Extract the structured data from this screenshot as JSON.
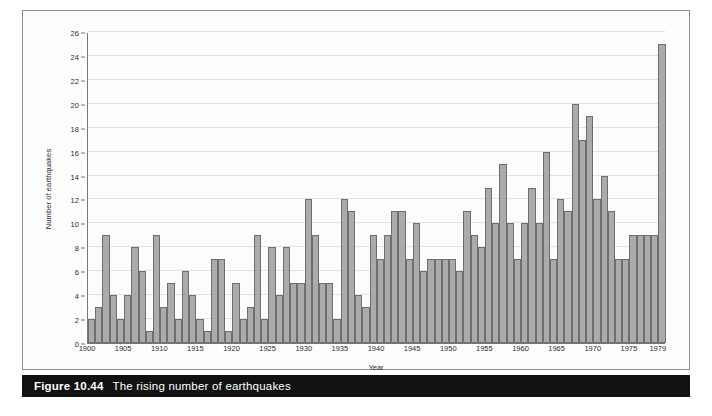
{
  "figure": {
    "caption_number": "Figure 10.44",
    "caption_text": "The rising number of earthquakes",
    "caption_bg": "#111111",
    "caption_fg": "#ffffff"
  },
  "style": {
    "bar_fill": "#ababab",
    "bar_stroke": "#6e6e6e",
    "gridline": "#e2e2e2",
    "axis": "#777777",
    "page_bg": "#ffffff",
    "frame_border": "#8d8d8d"
  },
  "chart_data": {
    "type": "bar",
    "title": "The rising number of earthquakes",
    "xlabel": "Year",
    "ylabel": "Number of earthquakes",
    "ylim": [
      0,
      26
    ],
    "ytick_step": 2,
    "yticks": [
      0,
      2,
      4,
      6,
      8,
      10,
      12,
      14,
      16,
      18,
      20,
      22,
      24,
      26
    ],
    "xticks": [
      1900,
      1905,
      1910,
      1915,
      1920,
      1925,
      1930,
      1935,
      1940,
      1945,
      1950,
      1955,
      1960,
      1965,
      1970,
      1975,
      1979
    ],
    "xlim": [
      1900,
      1980
    ],
    "grid": "horizontal",
    "legend": "none",
    "categories": [
      1900,
      1901,
      1902,
      1903,
      1904,
      1905,
      1906,
      1907,
      1908,
      1909,
      1910,
      1911,
      1912,
      1913,
      1914,
      1915,
      1916,
      1917,
      1918,
      1919,
      1920,
      1921,
      1922,
      1923,
      1924,
      1925,
      1926,
      1927,
      1928,
      1929,
      1930,
      1931,
      1932,
      1933,
      1934,
      1935,
      1936,
      1937,
      1938,
      1939,
      1940,
      1941,
      1942,
      1943,
      1944,
      1945,
      1946,
      1947,
      1948,
      1949,
      1950,
      1951,
      1952,
      1953,
      1954,
      1955,
      1956,
      1957,
      1958,
      1959,
      1960,
      1961,
      1962,
      1963,
      1964,
      1965,
      1966,
      1967,
      1968,
      1969,
      1970,
      1971,
      1972,
      1973,
      1974,
      1975,
      1976,
      1977,
      1978,
      1979
    ],
    "values": [
      2,
      3,
      9,
      4,
      2,
      4,
      8,
      6,
      1,
      9,
      3,
      5,
      2,
      6,
      4,
      2,
      1,
      7,
      7,
      1,
      5,
      2,
      3,
      9,
      2,
      8,
      4,
      8,
      5,
      5,
      12,
      9,
      5,
      5,
      2,
      12,
      11,
      4,
      3,
      9,
      7,
      9,
      11,
      11,
      7,
      10,
      6,
      7,
      7,
      7,
      7,
      6,
      11,
      9,
      8,
      13,
      10,
      15,
      10,
      7,
      10,
      13,
      10,
      16,
      7,
      12,
      11,
      20,
      17,
      19,
      12,
      14,
      11,
      7,
      7,
      9,
      9,
      9,
      9,
      25
    ],
    "series": [
      {
        "name": "Number of earthquakes",
        "values": [
          2,
          3,
          9,
          4,
          2,
          4,
          8,
          6,
          1,
          9,
          3,
          5,
          2,
          6,
          4,
          2,
          1,
          7,
          7,
          1,
          5,
          2,
          3,
          9,
          2,
          8,
          4,
          8,
          5,
          5,
          12,
          9,
          5,
          5,
          2,
          12,
          11,
          4,
          3,
          9,
          7,
          9,
          11,
          11,
          7,
          10,
          6,
          7,
          7,
          7,
          7,
          6,
          11,
          9,
          8,
          13,
          10,
          15,
          10,
          7,
          10,
          13,
          10,
          16,
          7,
          12,
          11,
          20,
          17,
          19,
          12,
          14,
          11,
          7,
          7,
          9,
          9,
          9,
          9,
          25
        ]
      }
    ]
  }
}
